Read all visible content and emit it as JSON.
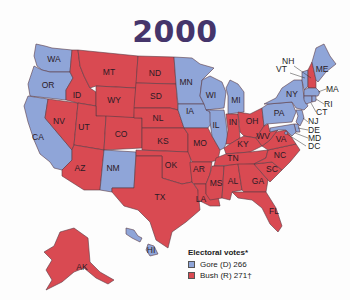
{
  "title": "2000",
  "colors": {
    "gore": "#8fa5d8",
    "bush": "#d94a52",
    "title": "#45356b",
    "water": "#ffffff"
  },
  "legend": {
    "header": "Electoral votes*",
    "items": [
      {
        "label": "Gore (D) 266",
        "party": "D",
        "color": "#8fa5d8"
      },
      {
        "label": "Bush (R) 271†",
        "party": "R",
        "color": "#d94a52"
      }
    ]
  },
  "states": {
    "WA": "D",
    "OR": "D",
    "CA": "D",
    "NV": "R",
    "ID": "R",
    "MT": "R",
    "WY": "R",
    "UT": "R",
    "AZ": "R",
    "CO": "R",
    "NM": "D",
    "ND": "R",
    "SD": "R",
    "NL": "R",
    "KS": "R",
    "OK": "R",
    "TX": "R",
    "MN": "D",
    "IA": "D",
    "MO": "R",
    "AR": "R",
    "LA": "R",
    "WI": "D",
    "IL": "D",
    "MI": "D",
    "IN": "R",
    "OH": "R",
    "KY": "R",
    "TN": "R",
    "MS": "R",
    "AL": "R",
    "GA": "R",
    "FL": "R",
    "SC": "R",
    "NC": "R",
    "VA": "R",
    "WV": "R",
    "PA": "D",
    "NY": "D",
    "ME": "D",
    "NH": "R",
    "VT": "D",
    "MA": "D",
    "RI": "D",
    "CT": "D",
    "NJ": "D",
    "DE": "D",
    "MD": "D",
    "DC": "D",
    "AK": "R",
    "HI": "D"
  },
  "labels": {
    "WA": "WA",
    "OR": "OR",
    "CA": "CA",
    "NV": "NV",
    "ID": "ID",
    "MT": "MT",
    "WY": "WY",
    "UT": "UT",
    "AZ": "AZ",
    "CO": "CO",
    "NM": "NM",
    "ND": "ND",
    "SD": "SD",
    "NL": "NL",
    "KS": "KS",
    "OK": "OK",
    "TX": "TX",
    "MN": "MN",
    "IA": "IA",
    "MO": "MO",
    "AR": "AR",
    "LA": "LA",
    "WI": "WI",
    "IL": "IL",
    "MI": "MI",
    "IN": "IN",
    "OH": "OH",
    "KY": "KY",
    "TN": "TN",
    "MS": "MS",
    "AL": "AL",
    "GA": "GA",
    "FL": "FL",
    "SC": "SC",
    "NC": "NC",
    "VA": "VA",
    "WV": "WV",
    "PA": "PA",
    "NY": "NY",
    "ME": "ME",
    "NH": "NH",
    "VT": "VT",
    "MA": "MA",
    "RI": "RI",
    "CT": "CT",
    "NJ": "NJ",
    "DE": "DE",
    "MD": "MD",
    "DC": "DC",
    "AK": "AK",
    "HI": "HI"
  }
}
